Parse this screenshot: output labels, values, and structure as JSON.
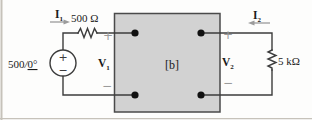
{
  "figure": {
    "source": {
      "magnitude": "500",
      "angle_slash": "/",
      "angle": "0°",
      "plus": "+",
      "minus": "−"
    },
    "left_branch": {
      "current_symbol": "I",
      "current_sub": "1",
      "resistor_label": "500 Ω"
    },
    "network_box": {
      "label": "[b]"
    },
    "port1": {
      "voltage_symbol": "V",
      "voltage_sub": "1",
      "plus": "+",
      "minus": "−"
    },
    "port2": {
      "voltage_symbol": "V",
      "voltage_sub": "2",
      "plus": "+",
      "minus": "−"
    },
    "right_branch": {
      "current_symbol": "I",
      "current_sub": "2",
      "resistor_label": "5 kΩ"
    }
  },
  "colors": {
    "wire": "#3c3c3c",
    "box_fill": "#d2d2d2",
    "box_border": "#4a4a4a",
    "accent": "#9b9b9b",
    "text": "#1a1a1a",
    "frame": "#c6c2ba",
    "background": "#fdfdfc"
  }
}
